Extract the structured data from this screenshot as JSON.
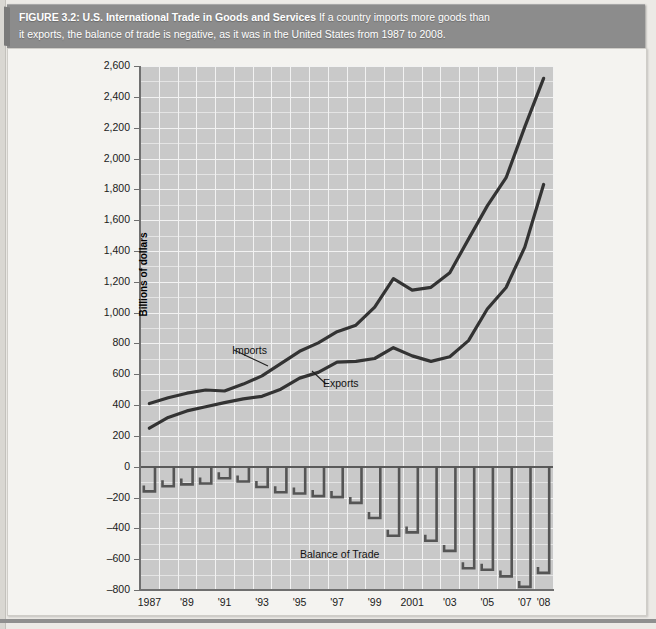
{
  "caption": {
    "figure_label": "FIGURE 3.2: U.S. International Trade in Goods and Services",
    "line1_rest": "If a country imports more goods than",
    "line2": "it exports, the balance of trade is negative, as it was in the United States from 1987 to 2008."
  },
  "axis": {
    "ylabel": "Billions of dollars",
    "yticks": [
      "2,600",
      "2,400",
      "2,200",
      "2,000",
      "1,800",
      "1,600",
      "1,400",
      "1,200",
      "1,000",
      "800",
      "600",
      "400",
      "200",
      "0",
      "–200",
      "–400",
      "–600",
      "–800"
    ],
    "xticks": [
      "1987",
      "'89",
      "'91",
      "'93",
      "'95",
      "'97",
      "'99",
      "2001",
      "'03",
      "'05",
      "'07",
      "'08"
    ]
  },
  "labels": {
    "imports": "Imports",
    "exports": "Exports",
    "balance": "Balance of Trade"
  },
  "colors": {
    "caption_bar": "#8c8c8c",
    "plot_background": "#c9c9c9",
    "gridline": "#f2f2f2",
    "series_line": "#333333",
    "bar": "#555555",
    "page": "#eceae6"
  },
  "chart_data": {
    "type": "line",
    "title": "U.S. International Trade in Goods and Services",
    "xlabel": "",
    "ylabel": "Billions of dollars",
    "ylim": [
      -800,
      2600
    ],
    "ytick_step": 200,
    "grid": true,
    "legend": "inline-annotations",
    "x": [
      1987,
      1988,
      1989,
      1990,
      1991,
      1992,
      1993,
      1994,
      1995,
      1996,
      1997,
      1998,
      1999,
      2000,
      2001,
      2002,
      2003,
      2004,
      2005,
      2006,
      2007,
      2008
    ],
    "series": [
      {
        "name": "Imports",
        "values": [
          410,
          447,
          477,
          498,
          491,
          536,
          589,
          669,
          749,
          803,
          876,
          918,
          1035,
          1220,
          1145,
          1164,
          1259,
          1477,
          1692,
          1875,
          2205,
          2520
        ]
      },
      {
        "name": "Exports",
        "values": [
          250,
          320,
          362,
          389,
          416,
          440,
          457,
          503,
          575,
          612,
          679,
          683,
          702,
          772,
          719,
          683,
          713,
          818,
          1023,
          1163,
          1425,
          1831
        ]
      },
      {
        "name": "Balance of Trade",
        "values": [
          -160,
          -127,
          -115,
          -109,
          -75,
          -96,
          -132,
          -166,
          -174,
          -191,
          -197,
          -235,
          -333,
          -448,
          -426,
          -481,
          -546,
          -659,
          -669,
          -712,
          -780,
          -689
        ]
      }
    ]
  }
}
